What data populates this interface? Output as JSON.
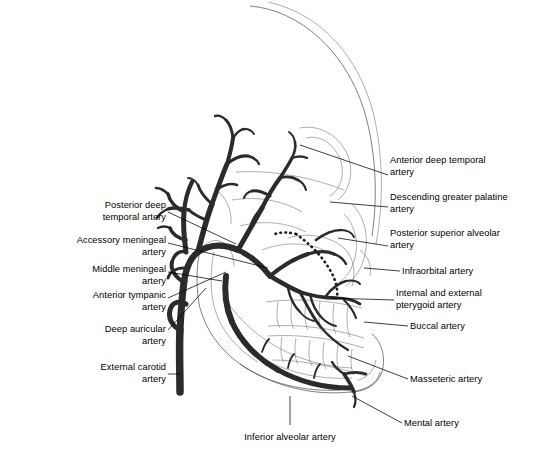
{
  "figure": {
    "background_color": "#ffffff",
    "ink_color": "#2b2b2b",
    "bone_color": "#4a4a4a"
  },
  "labels_left": [
    {
      "id": "posterior-deep-temporal-artery",
      "text": "Posterior deep\ntemporal artery",
      "x": 40,
      "y": 200,
      "width": 126,
      "align": "right"
    },
    {
      "id": "accessory-meningeal-artery",
      "text": "Accessory meningeal\nartery",
      "x": 8,
      "y": 235,
      "width": 158,
      "align": "right"
    },
    {
      "id": "middle-meningeal-artery",
      "text": "Middle meningeal\nartery",
      "x": 8,
      "y": 264,
      "width": 158,
      "align": "right"
    },
    {
      "id": "anterior-tympanic-artery",
      "text": "Anterior tympanic\nartery",
      "x": 44,
      "y": 290,
      "width": 122,
      "align": "right"
    },
    {
      "id": "deep-auricular-artery",
      "text": "Deep auricular\nartery",
      "x": 44,
      "y": 324,
      "width": 122,
      "align": "right"
    },
    {
      "id": "external-carotid-artery",
      "text": "External carotid\nartery",
      "x": 32,
      "y": 362,
      "width": 134,
      "align": "right"
    }
  ],
  "labels_right": [
    {
      "id": "anterior-deep-temporal-artery",
      "text": "Anterior deep temporal\nartery",
      "x": 390,
      "y": 155,
      "width": 142,
      "align": "left"
    },
    {
      "id": "descending-greater-palatine-artery",
      "text": "Descending greater palatine\nartery",
      "x": 390,
      "y": 192,
      "width": 144,
      "align": "left"
    },
    {
      "id": "posterior-superior-alveolar-artery",
      "text": "Posterior superior alveolar\nartery",
      "x": 390,
      "y": 228,
      "width": 144,
      "align": "left"
    },
    {
      "id": "infraorbital-artery",
      "text": "Infraorbital artery",
      "x": 402,
      "y": 266,
      "width": 130,
      "align": "left"
    },
    {
      "id": "internal-and-external-pterygoid-artery",
      "text": "Internal and external\npterygoid artery",
      "x": 396,
      "y": 288,
      "width": 136,
      "align": "left"
    },
    {
      "id": "buccal-artery",
      "text": "Buccal artery",
      "x": 410,
      "y": 321,
      "width": 122,
      "align": "left"
    },
    {
      "id": "masseteric-artery",
      "text": "Masseteric artery",
      "x": 410,
      "y": 374,
      "width": 122,
      "align": "left"
    },
    {
      "id": "mental-artery",
      "text": "Mental artery",
      "x": 404,
      "y": 418,
      "width": 122,
      "align": "left"
    }
  ],
  "labels_bottom": [
    {
      "id": "inferior-alveolar-artery",
      "text": "Inferior alveolar artery",
      "x": 224,
      "y": 432,
      "width": 132,
      "align": "center"
    }
  ],
  "structures": [
    {
      "id": "cranium-outline",
      "name": "cranial vault outline"
    },
    {
      "id": "facial-skeleton",
      "name": "facial skeleton and maxilla"
    },
    {
      "id": "mandible-outline",
      "name": "mandible with ramus and body"
    },
    {
      "id": "upper-teeth-row",
      "name": "maxillary dentition"
    },
    {
      "id": "lower-teeth-row",
      "name": "mandibular dentition"
    },
    {
      "id": "arterial-tree",
      "name": "maxillary artery and branches"
    },
    {
      "id": "descending-palatine-dashed",
      "name": "descending greater palatine artery (hidden, dashed)"
    }
  ]
}
